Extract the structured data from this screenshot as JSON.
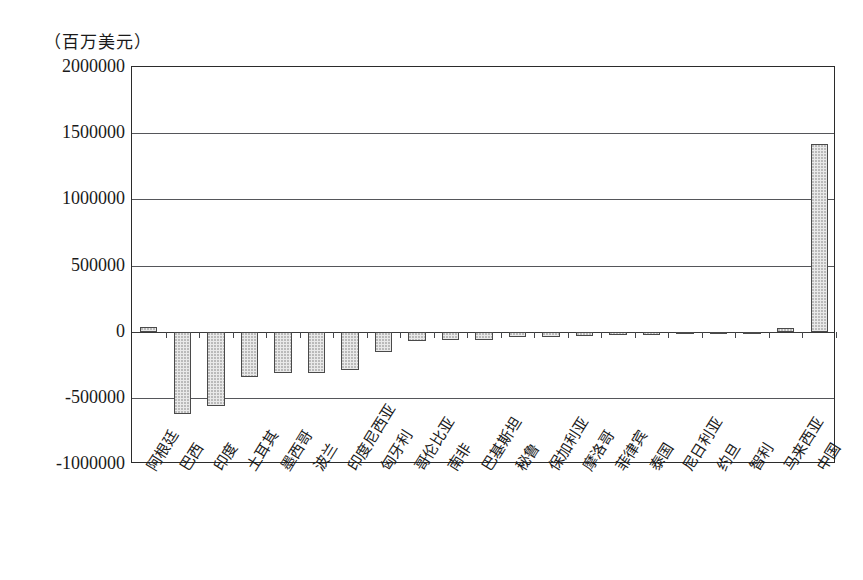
{
  "unit_caption": "（百万美元）",
  "chart_data": {
    "type": "bar",
    "title": "",
    "xlabel": "",
    "ylabel": "（百万美元）",
    "ylim": [
      -1000000,
      2000000
    ],
    "yticks": [
      2000000,
      1500000,
      1000000,
      500000,
      0,
      -500000,
      -1000000
    ],
    "ytick_labels": [
      "2000000",
      "1500000",
      "1000000",
      "500000",
      "0",
      "-500000",
      "-1000000"
    ],
    "grid": true,
    "legend": "none",
    "bar_color": "#e9e9e9",
    "bar_edge_color": "#4a4a4a",
    "categories": [
      "阿根廷",
      "巴西",
      "印度",
      "土耳其",
      "墨西哥",
      "波兰",
      "印度尼西亚",
      "匈牙利",
      "哥伦比亚",
      "南非",
      "巴基斯坦",
      "秘鲁",
      "保加利亚",
      "摩洛哥",
      "菲律宾",
      "泰国",
      "尼日利亚",
      "约旦",
      "智利",
      "马来西亚",
      "中国"
    ],
    "values": [
      35000,
      -620000,
      -565000,
      -340000,
      -315000,
      -310000,
      -290000,
      -150000,
      -72000,
      -62000,
      -60000,
      -42000,
      -38000,
      -30000,
      -26000,
      -22000,
      -18000,
      -10000,
      -8000,
      25000,
      1420000
    ]
  }
}
